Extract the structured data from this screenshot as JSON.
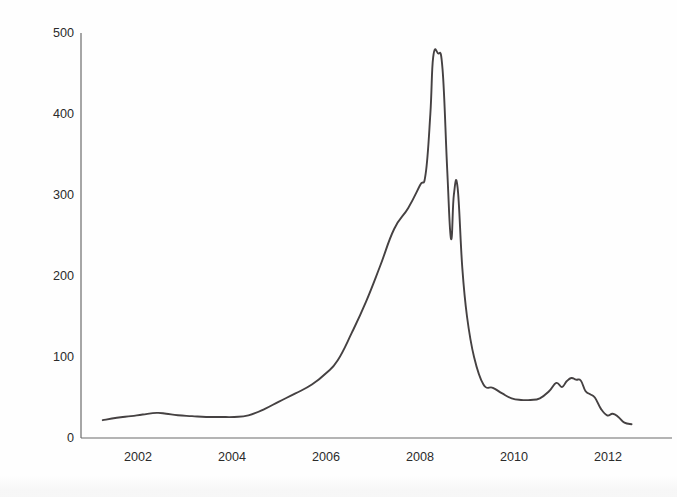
{
  "chart_data": {
    "type": "line",
    "title": "",
    "xlabel": "",
    "ylabel": "Average Spot Price (USD/kg)",
    "xlim": [
      2001.0,
      2012.6
    ],
    "ylim": [
      0,
      500
    ],
    "grid": false,
    "legend": null,
    "x_ticks": [
      "2002",
      "2004",
      "2006",
      "2008",
      "2010",
      "2012"
    ],
    "x_tick_values": [
      2002,
      2004,
      2006,
      2008,
      2010,
      2012
    ],
    "y_ticks": [
      "0",
      "100",
      "200",
      "300",
      "400",
      "500"
    ],
    "y_tick_values": [
      0,
      100,
      200,
      300,
      400,
      500
    ],
    "line_color": "#454142",
    "line_width": 1.9,
    "series": [
      {
        "name": "Average Spot Price",
        "x": [
          2001.25,
          2001.55,
          2001.85,
          2002.1,
          2002.4,
          2002.6,
          2002.85,
          2003.15,
          2003.45,
          2003.75,
          2004.05,
          2004.35,
          2004.7,
          2005.0,
          2005.35,
          2005.7,
          2006.0,
          2006.25,
          2006.55,
          2006.85,
          2007.15,
          2007.45,
          2007.75,
          2008.0,
          2008.12,
          2008.22,
          2008.28,
          2008.38,
          2008.48,
          2008.58,
          2008.66,
          2008.72,
          2008.8,
          2008.9,
          2009.0,
          2009.15,
          2009.35,
          2009.55,
          2009.75,
          2009.95,
          2010.15,
          2010.35,
          2010.55,
          2010.75,
          2010.9,
          2011.02,
          2011.12,
          2011.22,
          2011.32,
          2011.42,
          2011.52,
          2011.62,
          2011.72,
          2011.85,
          2011.98,
          2012.1,
          2012.22,
          2012.35,
          2012.5
        ],
        "y": [
          22,
          25,
          27,
          29,
          31,
          30,
          28,
          27,
          26,
          26,
          26,
          28,
          36,
          45,
          55,
          66,
          80,
          96,
          130,
          168,
          212,
          258,
          284,
          312,
          326,
          400,
          470,
          475,
          455,
          330,
          246,
          300,
          309,
          210,
          150,
          100,
          66,
          62,
          55,
          49,
          47,
          47,
          49,
          58,
          68,
          63,
          70,
          74,
          72,
          71,
          58,
          54,
          50,
          36,
          28,
          30,
          26,
          19,
          17
        ]
      }
    ],
    "annotations": []
  },
  "axes": {
    "y_axis_visible": true,
    "x_axis_visible": true,
    "axis_color": "#6b6b6b"
  }
}
